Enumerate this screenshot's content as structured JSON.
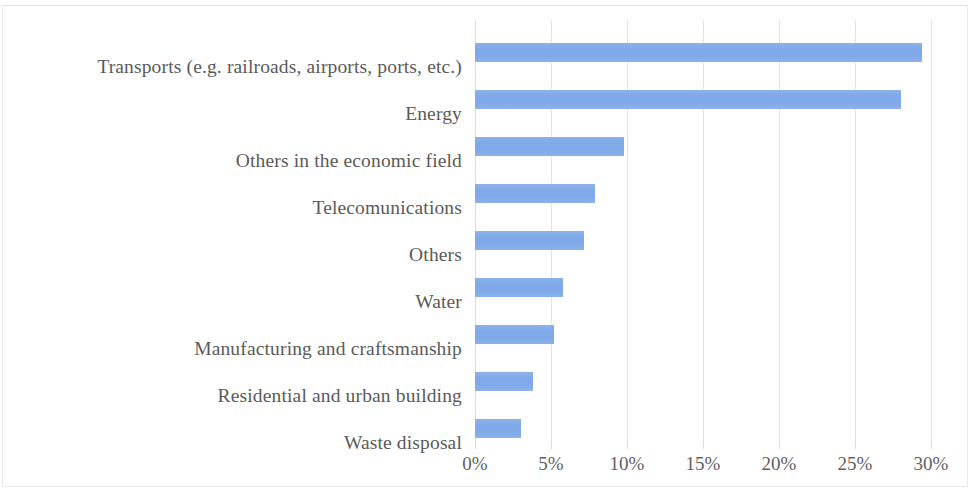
{
  "chart_data": {
    "type": "bar",
    "orientation": "horizontal",
    "title": "",
    "subtitle": "",
    "xlabel": "",
    "ylabel": "",
    "categories": [
      "Transports (e.g. railroads, airports, ports, etc.)",
      "Energy",
      "Others in the economic field",
      "Telecomunications",
      "Others",
      "Water",
      "Manufacturing and craftsmanship",
      "Residential and urban building",
      "Waste disposal"
    ],
    "values": [
      29.4,
      28.0,
      9.8,
      7.9,
      7.2,
      5.8,
      5.2,
      3.8,
      3.0
    ],
    "value_format": "percent",
    "xlim": [
      0,
      30
    ],
    "tick_values": [
      0,
      5,
      10,
      15,
      20,
      25,
      30
    ],
    "tick_labels": [
      "0%",
      "5%",
      "10%",
      "15%",
      "20%",
      "25%",
      "30%"
    ],
    "grid": {
      "vertical": true,
      "horizontal": false
    },
    "legend": {
      "visible": false,
      "position": "none"
    },
    "series": [
      {
        "name": "Share",
        "color": "#7FA9E8",
        "values": [
          29.4,
          28.0,
          9.8,
          7.9,
          7.2,
          5.8,
          5.2,
          3.8,
          3.0
        ]
      }
    ],
    "data_labels_visible": false
  },
  "colors": {
    "bar": "#7FA9E8",
    "gridline": "#E4E4E4",
    "text": "#595959",
    "background": "#FFFFFF",
    "frame": "#E9E9E9"
  }
}
